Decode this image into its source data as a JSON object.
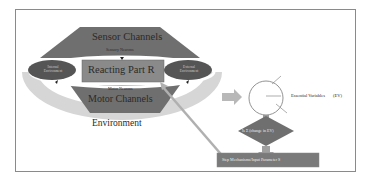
{
  "diagram": {
    "sensor_channels": "Sensor Channels",
    "sensor_neurons": "Sensory Neurons",
    "reacting_part": "Reacting Part R",
    "motor_neurons": "Motor Neurons",
    "motor_channels": "Motor Channels",
    "environment": "Environment",
    "left_ellipse": "Internal Environment",
    "right_ellipse": "External Environment",
    "essential_variables": "Essential Variables",
    "ev_abbrev": "(EV)",
    "decision": "Is Σ (change in EV)",
    "decision_symbol": "Σ",
    "step_box": "Step Mechanisms/Input Parameter S"
  },
  "colors": {
    "trapezoid": "#6f6f6f",
    "reacting_box": "#8a8a8a",
    "ellipse": "#555555",
    "environment_arc": "#d4d4d4",
    "arrow": "#b8b8b8",
    "step_box": "#7a7a7a"
  }
}
